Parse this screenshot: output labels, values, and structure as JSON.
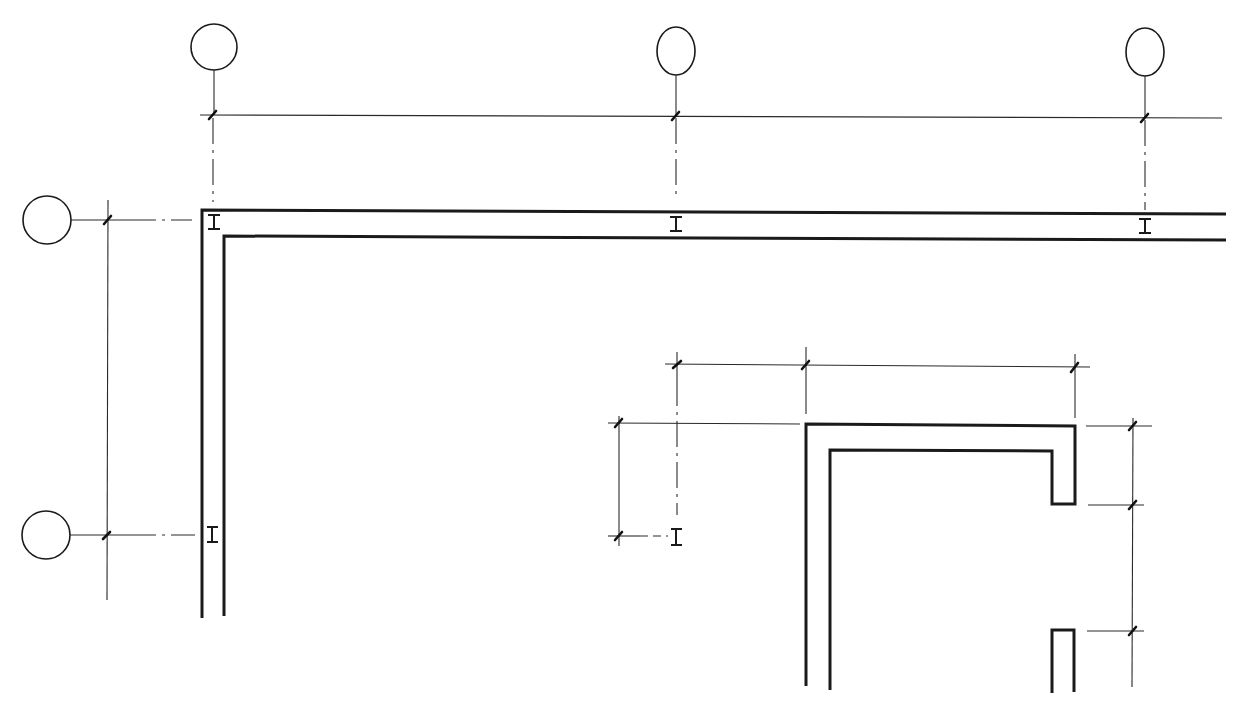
{
  "drawing": {
    "type": "architectural-plan-detail",
    "line_color": "#1a1a1a",
    "background": "#ffffff",
    "grid_bubbles": [
      {
        "id": "grid-bubble-top-1",
        "cx": 214,
        "cy": 47,
        "rx": 23,
        "ry": 23,
        "leader_to_y": 115
      },
      {
        "id": "grid-bubble-top-2",
        "cx": 676,
        "cy": 51,
        "rx": 19,
        "ry": 24,
        "leader_to_y": 115
      },
      {
        "id": "grid-bubble-top-3",
        "cx": 1145,
        "cy": 52,
        "rx": 19,
        "ry": 24,
        "leader_to_y": 118
      },
      {
        "id": "grid-bubble-left-1",
        "cx": 47,
        "cy": 220,
        "rx": 24,
        "ry": 24
      },
      {
        "id": "grid-bubble-left-2",
        "cx": 46,
        "cy": 535,
        "rx": 24,
        "ry": 24
      }
    ],
    "walls": {
      "main_outer": [
        [
          202,
          618
        ],
        [
          202,
          210
        ],
        [
          1226,
          214
        ]
      ],
      "main_inner": [
        [
          224,
          616
        ],
        [
          224,
          236
        ],
        [
          1226,
          240
        ]
      ],
      "room_outer": [
        [
          806,
          686
        ],
        [
          806,
          424
        ],
        [
          1075,
          426
        ],
        [
          1075,
          504
        ],
        [
          1052,
          504
        ],
        [
          1052,
          451
        ],
        [
          830,
          450
        ],
        [
          830,
          690
        ]
      ],
      "room_stub": [
        [
          1052,
          693
        ],
        [
          1052,
          630
        ],
        [
          1074,
          630
        ],
        [
          1074,
          692
        ]
      ]
    },
    "column_markers": [
      {
        "x": 214,
        "y": 221
      },
      {
        "x": 676,
        "y": 224
      },
      {
        "x": 1145,
        "y": 227
      },
      {
        "x": 212,
        "y": 534
      },
      {
        "x": 676,
        "y": 537
      }
    ]
  }
}
